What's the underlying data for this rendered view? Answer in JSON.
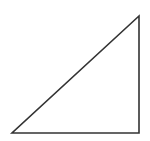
{
  "diagram": {
    "type": "right-triangle",
    "background": "#ffffff",
    "stroke": "#333333",
    "stroke_width": 1.6,
    "fill": "#ffffff",
    "vertices": {
      "bottom_left": [
        12,
        133
      ],
      "bottom_right": [
        139,
        133
      ],
      "top_right": [
        139,
        16
      ]
    }
  }
}
